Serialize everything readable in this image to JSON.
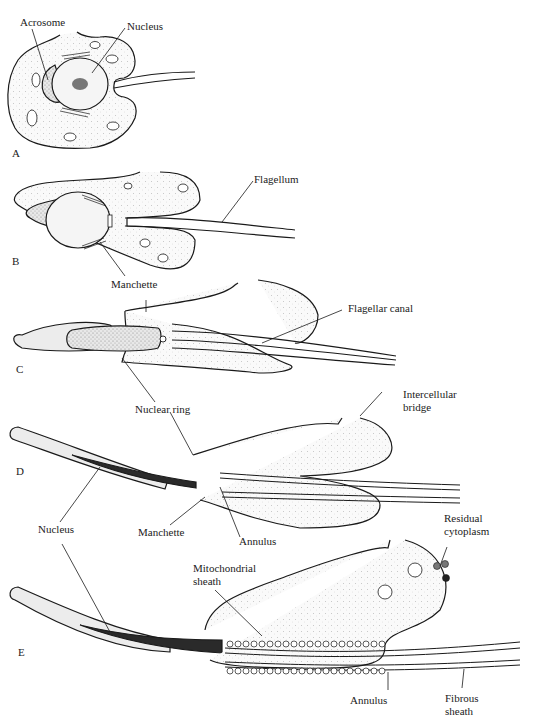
{
  "figure": {
    "stages": [
      {
        "id": "A",
        "label": "A"
      },
      {
        "id": "B",
        "label": "B"
      },
      {
        "id": "C",
        "label": "C"
      },
      {
        "id": "D",
        "label": "D"
      },
      {
        "id": "E",
        "label": "E"
      }
    ],
    "labels": {
      "a_acrosome": "Acrosome",
      "a_nucleus": "Nucleus",
      "b_flagellum": "Flagellum",
      "b_manchette": "Manchette",
      "c_flagellar_canal": "Flagellar canal",
      "c_nuclear_ring": "Nuclear ring",
      "d_intercellular_bridge_1": "Intercellular",
      "d_intercellular_bridge_2": "bridge",
      "d_nucleus": "Nucleus",
      "d_manchette": "Manchette",
      "d_annulus": "Annulus",
      "e_residual_cytoplasm_1": "Residual",
      "e_residual_cytoplasm_2": "cytoplasm",
      "e_mitochondrial_sheath_1": "Mitochondrial",
      "e_mitochondrial_sheath_2": "sheath",
      "e_annulus": "Annulus",
      "e_fibrous_sheath_1": "Fibrous",
      "e_fibrous_sheath_2": "sheath"
    },
    "colors": {
      "ink": "#1a1a1a",
      "stipple": "#e6e6e6",
      "dark_fill": "#2a2a2a"
    }
  }
}
